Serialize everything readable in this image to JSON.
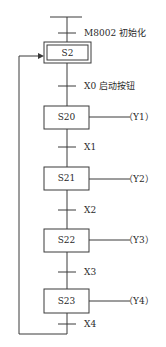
{
  "diagram": {
    "type": "SFC sequential function chart",
    "initial_step": {
      "name": "S2",
      "double_border": true
    },
    "initial_transition": {
      "condition": "M8002 初始化"
    },
    "steps": [
      {
        "name": "S20",
        "output": "（Y1）"
      },
      {
        "name": "S21",
        "output": "（Y2）"
      },
      {
        "name": "S22",
        "output": "（Y3）"
      },
      {
        "name": "S23",
        "output": "（Y4）"
      }
    ],
    "transitions": [
      {
        "condition": "X0 启动按钮"
      },
      {
        "condition": "X1"
      },
      {
        "condition": "X2"
      },
      {
        "condition": "X3"
      },
      {
        "condition": "X4"
      }
    ],
    "loop_back_to": "S2",
    "colors": {
      "line": "#3a3a3a",
      "background": "#ffffff"
    }
  }
}
